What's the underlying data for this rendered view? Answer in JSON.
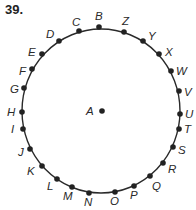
{
  "problem_number": "39.",
  "circle": {
    "cx": 101,
    "cy": 111,
    "rx": 79,
    "ry": 82,
    "stroke": "#2a2a2a"
  },
  "center_point": {
    "label": "A",
    "x": 102,
    "y": 111,
    "lx": 86,
    "ly": 115
  },
  "points": [
    {
      "label": "B",
      "x": 99,
      "y": 27,
      "lx": 95,
      "ly": 20
    },
    {
      "label": "C",
      "x": 79,
      "y": 31,
      "lx": 72,
      "ly": 26
    },
    {
      "label": "D",
      "x": 59,
      "y": 41,
      "lx": 46,
      "ly": 38
    },
    {
      "label": "E",
      "x": 42,
      "y": 54,
      "lx": 28,
      "ly": 56
    },
    {
      "label": "F",
      "x": 32,
      "y": 69,
      "lx": 19,
      "ly": 75
    },
    {
      "label": "G",
      "x": 24,
      "y": 88,
      "lx": 10,
      "ly": 93
    },
    {
      "label": "H",
      "x": 22,
      "y": 112,
      "lx": 7,
      "ly": 116
    },
    {
      "label": "I",
      "x": 23,
      "y": 129,
      "lx": 11,
      "ly": 133
    },
    {
      "label": "J",
      "x": 30,
      "y": 149,
      "lx": 18,
      "ly": 156
    },
    {
      "label": "K",
      "x": 42,
      "y": 166,
      "lx": 27,
      "ly": 175
    },
    {
      "label": "L",
      "x": 57,
      "y": 179,
      "lx": 47,
      "ly": 190
    },
    {
      "label": "M",
      "x": 72,
      "y": 187,
      "lx": 63,
      "ly": 200
    },
    {
      "label": "N",
      "x": 89,
      "y": 193,
      "lx": 84,
      "ly": 206
    },
    {
      "label": "O",
      "x": 115,
      "y": 192,
      "lx": 110,
      "ly": 205
    },
    {
      "label": "P",
      "x": 134,
      "y": 186,
      "lx": 130,
      "ly": 199
    },
    {
      "label": "Q",
      "x": 150,
      "y": 176,
      "lx": 152,
      "ly": 190
    },
    {
      "label": "R",
      "x": 163,
      "y": 163,
      "lx": 168,
      "ly": 173
    },
    {
      "label": "S",
      "x": 173,
      "y": 147,
      "lx": 178,
      "ly": 154
    },
    {
      "label": "T",
      "x": 179,
      "y": 129,
      "lx": 184,
      "ly": 133
    },
    {
      "label": "U",
      "x": 180,
      "y": 114,
      "lx": 185,
      "ly": 118
    },
    {
      "label": "V",
      "x": 179,
      "y": 91,
      "lx": 184,
      "ly": 96
    },
    {
      "label": "W",
      "x": 171,
      "y": 71,
      "lx": 176,
      "ly": 75
    },
    {
      "label": "X",
      "x": 159,
      "y": 54,
      "lx": 165,
      "ly": 56
    },
    {
      "label": "Y",
      "x": 143,
      "y": 41,
      "lx": 148,
      "ly": 40
    },
    {
      "label": "Z",
      "x": 124,
      "y": 32,
      "lx": 122,
      "ly": 25
    }
  ]
}
